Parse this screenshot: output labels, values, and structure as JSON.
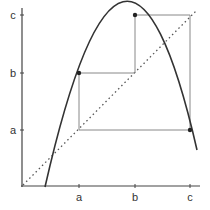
{
  "diagram": {
    "type": "cobweb-plot",
    "axes": {
      "x_tick_labels": [
        "a",
        "b",
        "c"
      ],
      "y_tick_labels": [
        "a",
        "b",
        "c"
      ]
    },
    "curve": {
      "shape": "inverted-parabola",
      "color": "#333333"
    },
    "identity_line": {
      "style": "dotted",
      "color": "#555555"
    },
    "cobweb": {
      "color": "#888888",
      "points": [
        {
          "label": "f(a)=b",
          "x": "a",
          "y": "b"
        },
        {
          "label": "f(b)=c",
          "x": "b",
          "y": "c"
        },
        {
          "label": "f(c)=a",
          "x": "c",
          "y": "a"
        }
      ]
    }
  },
  "labels": {
    "x_a": "a",
    "x_b": "b",
    "x_c": "c",
    "y_a": "a",
    "y_b": "b",
    "y_c": "c"
  }
}
